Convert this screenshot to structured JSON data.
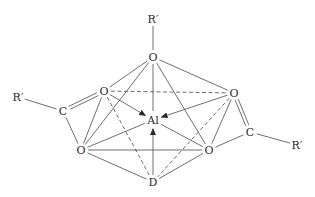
{
  "diagram": {
    "type": "chemical-structure",
    "atoms": {
      "r_top": {
        "label": "R′",
        "x": 153,
        "y": 19
      },
      "o_top": {
        "label": "O",
        "x": 153,
        "y": 57
      },
      "o_ul": {
        "label": "O",
        "x": 104,
        "y": 91
      },
      "o_ur": {
        "label": "O",
        "x": 234,
        "y": 93
      },
      "r_left": {
        "label": "R′",
        "x": 18,
        "y": 97
      },
      "c_left": {
        "label": "C",
        "x": 63,
        "y": 111
      },
      "al": {
        "label": "Al",
        "x": 153,
        "y": 120
      },
      "c_right": {
        "label": "C",
        "x": 250,
        "y": 132
      },
      "r_right": {
        "label": "R′",
        "x": 297,
        "y": 145
      },
      "o_ll": {
        "label": "O",
        "x": 81,
        "y": 150
      },
      "o_lr": {
        "label": "O",
        "x": 209,
        "y": 150
      },
      "d": {
        "label": "D",
        "x": 153,
        "y": 182
      }
    },
    "bonds": [
      {
        "from": "r_top",
        "to": "o_top",
        "style": "single"
      },
      {
        "from": "o_top",
        "to": "o_ul",
        "style": "single"
      },
      {
        "from": "o_top",
        "to": "o_ur",
        "style": "single"
      },
      {
        "from": "o_top",
        "to": "o_ll",
        "style": "single"
      },
      {
        "from": "o_top",
        "to": "o_lr",
        "style": "single"
      },
      {
        "from": "o_top",
        "to": "al",
        "style": "single"
      },
      {
        "from": "o_ul",
        "to": "c_left",
        "style": "double"
      },
      {
        "from": "c_left",
        "to": "r_left",
        "style": "single"
      },
      {
        "from": "c_left",
        "to": "o_ll",
        "style": "single"
      },
      {
        "from": "o_ur",
        "to": "c_right",
        "style": "double"
      },
      {
        "from": "c_right",
        "to": "r_right",
        "style": "single"
      },
      {
        "from": "c_right",
        "to": "o_lr",
        "style": "single"
      },
      {
        "from": "o_ul",
        "to": "o_ur",
        "style": "dashed"
      },
      {
        "from": "o_ul",
        "to": "o_ll",
        "style": "single"
      },
      {
        "from": "o_ul",
        "to": "d",
        "style": "dashed"
      },
      {
        "from": "o_ur",
        "to": "o_lr",
        "style": "single"
      },
      {
        "from": "o_ur",
        "to": "d",
        "style": "dashed"
      },
      {
        "from": "o_ll",
        "to": "o_lr",
        "style": "single"
      },
      {
        "from": "o_ll",
        "to": "al",
        "style": "single"
      },
      {
        "from": "o_ll",
        "to": "d",
        "style": "single"
      },
      {
        "from": "o_lr",
        "to": "al",
        "style": "single"
      },
      {
        "from": "o_lr",
        "to": "d",
        "style": "single"
      },
      {
        "from": "o_ul",
        "to": "al",
        "style": "arrow"
      },
      {
        "from": "o_ur",
        "to": "al",
        "style": "arrow"
      },
      {
        "from": "d",
        "to": "al",
        "style": "arrow"
      }
    ],
    "colors": {
      "line": "#4a4a4a",
      "text": "#2a2a2a",
      "background": "#ffffff"
    }
  }
}
